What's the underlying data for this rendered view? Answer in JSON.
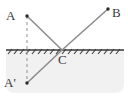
{
  "figure": {
    "type": "optics-reflection-ray-diagram",
    "width": 128,
    "height": 97,
    "background_color": "#ffffff",
    "stroke_color": "#8a8a8a",
    "surface_color": "#3a3a3a",
    "label_color": "#3a3a3a",
    "shade_color": "#f0f0f0"
  },
  "points": [
    {
      "id": "A",
      "label": "A",
      "x": 27,
      "y": 16,
      "dot": true
    },
    {
      "id": "B",
      "label": "B",
      "x": 108,
      "y": 9,
      "dot": true
    },
    {
      "id": "C",
      "label": "C",
      "x": 62,
      "y": 50,
      "dot": false
    },
    {
      "id": "Ap",
      "label": "A'",
      "x": 27,
      "y": 83,
      "dot": true
    }
  ],
  "surface": {
    "name": "mirror-surface",
    "y": 50,
    "x_start": 6,
    "x_end": 124,
    "hatching": true
  },
  "rays": [
    {
      "id": "incident",
      "from": "A",
      "to": "C",
      "style": "solid"
    },
    {
      "id": "reflected",
      "from": "C",
      "to": "B",
      "style": "solid"
    },
    {
      "id": "virtual",
      "from": "Ap",
      "to": "C",
      "style": "solid"
    },
    {
      "id": "normal",
      "from": "A",
      "to": "Ap",
      "style": "dashed"
    }
  ],
  "labels": {
    "A": "A",
    "B": "B",
    "C": "C",
    "A_prime": "A'"
  }
}
